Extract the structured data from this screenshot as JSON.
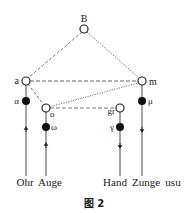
{
  "diagram": {
    "nodes": {
      "B": {
        "label": "B",
        "kind": "open"
      },
      "a": {
        "label": "a",
        "kind": "open"
      },
      "m": {
        "label": "m",
        "kind": "open"
      },
      "o": {
        "label": "o",
        "kind": "open"
      },
      "gr": {
        "label": "gr",
        "kind": "open"
      },
      "alpha": {
        "label": "α",
        "kind": "filled"
      },
      "mu": {
        "label": "μ",
        "kind": "filled"
      },
      "omega": {
        "label": "ω",
        "kind": "filled"
      },
      "gamma": {
        "label": "γ",
        "kind": "filled"
      }
    },
    "edges": [
      {
        "from": "B",
        "to": "a",
        "style": "dashed"
      },
      {
        "from": "B",
        "to": "m",
        "style": "dotted"
      },
      {
        "from": "a",
        "to": "m",
        "style": "dashed"
      },
      {
        "from": "a",
        "to": "o",
        "style": "dashed"
      },
      {
        "from": "o",
        "to": "m",
        "style": "dotted"
      },
      {
        "from": "o",
        "to": "gr",
        "style": "dashed"
      },
      {
        "from": "Ohr",
        "to": "alpha",
        "style": "solid-arrow-up"
      },
      {
        "from": "Auge",
        "to": "omega",
        "style": "solid-arrow-up"
      },
      {
        "from": "gamma",
        "to": "Hand",
        "style": "solid-arrow-down"
      },
      {
        "from": "mu",
        "to": "Zunge",
        "style": "solid-arrow-down"
      }
    ],
    "bottom_labels": {
      "ohr": "Ohr",
      "auge": "Auge",
      "hand": "Hand",
      "zunge": "Zunge",
      "usu": "usu"
    },
    "caption": "图 2"
  }
}
